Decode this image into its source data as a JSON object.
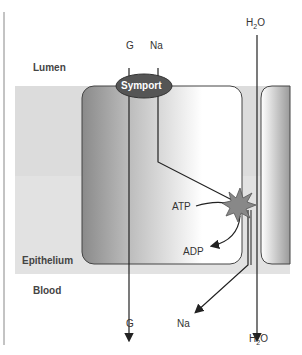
{
  "regions": {
    "lumen": "Lumen",
    "epithelium": "Epithelium",
    "blood": "Blood"
  },
  "transporter": {
    "label": "Symport"
  },
  "molecules": {
    "glucose_top": "G",
    "sodium_top": "Na",
    "water_top": "H2O",
    "glucose_bottom": "G",
    "sodium_bottom": "Na",
    "water_bottom": "H2O"
  },
  "pump": {
    "atp": "ATP",
    "adp": "ADP"
  },
  "colors": {
    "epithelium_band": "#d9d9d9",
    "symport": "#555555",
    "pump": "#808080",
    "line": "#222222"
  }
}
